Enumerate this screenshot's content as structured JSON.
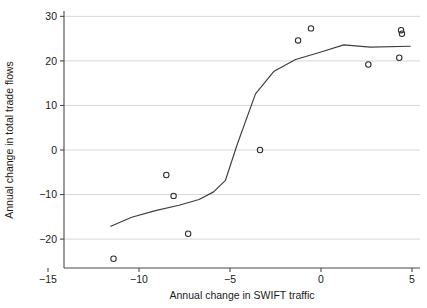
{
  "chart_data": {
    "type": "scatter",
    "title": "",
    "xlabel": "Annual change in SWIFT traffic",
    "ylabel": "Annual change in total trade flows",
    "xlim": [
      -16.5,
      5.8
    ],
    "ylim": [
      -27.5,
      31.5
    ],
    "xticks": [
      -15,
      -10,
      -5,
      0,
      5
    ],
    "yticks": [
      -20,
      -10,
      0,
      10,
      20,
      30
    ],
    "xticklabels": [
      "−15",
      "−10",
      "−5",
      "0",
      "5"
    ],
    "yticklabels": [
      "−20",
      "−10",
      "0",
      "10",
      "20",
      "30"
    ],
    "grid": "horizontal",
    "legend": "none",
    "marker": "open-circle",
    "series": [
      {
        "name": "observations",
        "type": "scatter",
        "points": [
          {
            "x": -11.4,
            "y": -24.4
          },
          {
            "x": -8.5,
            "y": -5.6
          },
          {
            "x": -8.1,
            "y": -10.3
          },
          {
            "x": -7.3,
            "y": -18.8
          },
          {
            "x": -3.35,
            "y": 0.0
          },
          {
            "x": -1.26,
            "y": 24.6
          },
          {
            "x": -0.55,
            "y": 27.3
          },
          {
            "x": 2.6,
            "y": 19.2
          },
          {
            "x": 4.3,
            "y": 20.7
          },
          {
            "x": 4.4,
            "y": 26.9
          },
          {
            "x": 4.45,
            "y": 26.1
          }
        ]
      },
      {
        "name": "fitted-line",
        "type": "line",
        "points": [
          {
            "x": -11.55,
            "y": -17.1
          },
          {
            "x": -10.4,
            "y": -15.1
          },
          {
            "x": -9.1,
            "y": -13.6
          },
          {
            "x": -7.8,
            "y": -12.4
          },
          {
            "x": -6.7,
            "y": -11.1
          },
          {
            "x": -5.9,
            "y": -9.4
          },
          {
            "x": -5.25,
            "y": -6.8
          },
          {
            "x": -4.6,
            "y": 1.3
          },
          {
            "x": -3.6,
            "y": 12.6
          },
          {
            "x": -2.6,
            "y": 17.6
          },
          {
            "x": -1.4,
            "y": 20.3
          },
          {
            "x": 0.0,
            "y": 22.0
          },
          {
            "x": 1.25,
            "y": 23.6
          },
          {
            "x": 2.7,
            "y": 23.1
          },
          {
            "x": 4.9,
            "y": 23.3
          }
        ]
      }
    ],
    "colors": {
      "marker_stroke": "#2b2b33",
      "line": "#3c3c46",
      "grid": "#d2d2d2",
      "axis": "#4a4a4a",
      "background": "#ffffff"
    }
  }
}
